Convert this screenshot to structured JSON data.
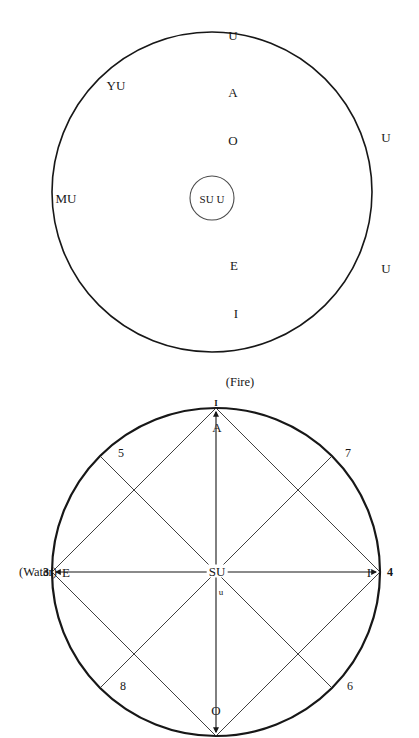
{
  "page": {
    "background": "#ffffff",
    "ink": "#171717",
    "width": 419,
    "height": 738
  },
  "figures": [
    {
      "id": "upper-vowel-circle",
      "name": "upper-circle-diagram",
      "outer_circle": {
        "cx": 212,
        "cy": 192,
        "r": 160,
        "stroke": "#171717",
        "stroke_width": 1.6
      },
      "inner_circle": {
        "cx": 212,
        "cy": 198,
        "r": 22,
        "stroke": "#4a4a4a",
        "stroke_width": 1.1
      },
      "center_label": "SU U",
      "outside_labels": [
        {
          "key": "top-u",
          "text": "U",
          "x": 233,
          "y": 35
        },
        {
          "key": "upper-left-yu",
          "text": "YU",
          "x": 116,
          "y": 85
        },
        {
          "key": "left-mu",
          "text": "MU",
          "x": 66,
          "y": 198
        },
        {
          "key": "right-u-upper",
          "text": "U",
          "x": 386,
          "y": 137
        },
        {
          "key": "right-u-lower",
          "text": "U",
          "x": 386,
          "y": 268
        }
      ],
      "inside_labels": [
        {
          "key": "a",
          "text": "A",
          "x": 233,
          "y": 92
        },
        {
          "key": "o",
          "text": "O",
          "x": 233,
          "y": 140
        },
        {
          "key": "e",
          "text": "E",
          "x": 234,
          "y": 265
        },
        {
          "key": "i",
          "text": "I",
          "x": 236,
          "y": 313
        }
      ]
    },
    {
      "id": "lower-element-circle",
      "name": "lower-circle-diagram",
      "outer_circle": {
        "cx": 216,
        "cy": 572,
        "r": 164,
        "stroke": "#171717",
        "stroke_width": 2.2
      },
      "axis_labels": {
        "fire": "(Fire)",
        "water": "(Water)"
      },
      "center_label": "SU",
      "center_sub_label": "u",
      "cardinal_labels": [
        {
          "key": "north-outer",
          "text": "I",
          "x": 216,
          "y": 402
        },
        {
          "key": "north-inner",
          "text": "A",
          "x": 216,
          "y": 427
        },
        {
          "key": "east-inner",
          "text": "I",
          "x": 369,
          "y": 572
        },
        {
          "key": "south-inner",
          "text": "O",
          "x": 216,
          "y": 711
        },
        {
          "key": "west-inner",
          "text": "E",
          "x": 65,
          "y": 572
        }
      ],
      "numbered_points": [
        {
          "key": "p3",
          "text": "3",
          "x": 44,
          "y": 572,
          "angle_deg": 180
        },
        {
          "key": "p4",
          "text": "4",
          "x": 393,
          "y": 572,
          "angle_deg": 0
        },
        {
          "key": "p5",
          "text": "5",
          "x": 120,
          "y": 453,
          "angle_deg": 135
        },
        {
          "key": "p7",
          "text": "7",
          "x": 348,
          "y": 453,
          "angle_deg": 45
        },
        {
          "key": "p8",
          "text": "8",
          "x": 122,
          "y": 686,
          "angle_deg": 225
        },
        {
          "key": "p6",
          "text": "6",
          "x": 350,
          "y": 686,
          "angle_deg": 315
        }
      ],
      "chords": [
        {
          "from": "north",
          "to": "east"
        },
        {
          "from": "east",
          "to": "south"
        },
        {
          "from": "south",
          "to": "west"
        },
        {
          "from": "west",
          "to": "north"
        }
      ],
      "diameters": [
        {
          "key": "vertical",
          "from": "north",
          "to": "south",
          "arrows": "both"
        },
        {
          "key": "horizontal",
          "from": "west",
          "to": "east",
          "arrows": "both"
        },
        {
          "key": "diag-5-6",
          "from": "p5",
          "to": "p6",
          "arrows": "none"
        },
        {
          "key": "diag-7-8",
          "from": "p7",
          "to": "p8",
          "arrows": "none"
        }
      ]
    }
  ]
}
